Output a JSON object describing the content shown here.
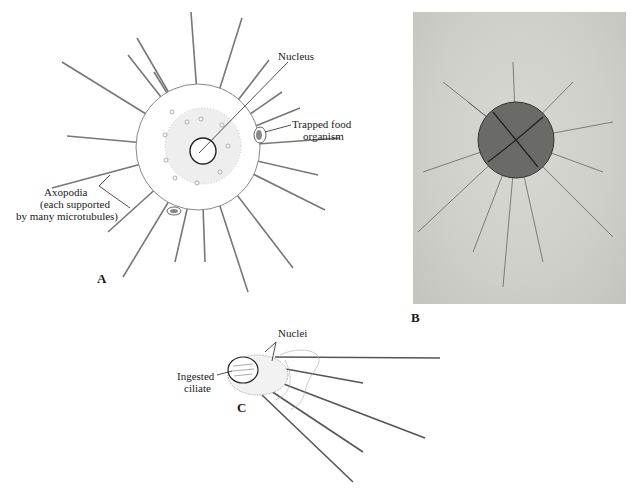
{
  "figure": {
    "panel_a": {
      "letter": "A",
      "labels": {
        "nucleus": "Nucleus",
        "trapped_food_1": "Trapped food",
        "trapped_food_2": "organism",
        "axopodia_1": "Axopodia",
        "axopodia_2": "(each supported",
        "axopodia_3": "by many microtubules)"
      }
    },
    "panel_b": {
      "letter": "B",
      "description": "photomicrograph of heliozoan"
    },
    "panel_c": {
      "letter": "C",
      "labels": {
        "nuclei": "Nuclei",
        "ingested_1": "Ingested",
        "ingested_2": "ciliate"
      }
    }
  }
}
